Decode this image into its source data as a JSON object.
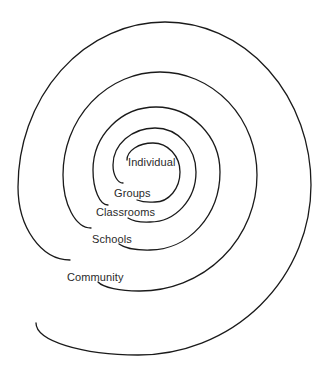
{
  "diagram": {
    "type": "spiral",
    "stroke_color": "#1a1a1a",
    "background": "#ffffff",
    "levels": [
      {
        "label": "Individual",
        "order": 1
      },
      {
        "label": "Groups",
        "order": 2
      },
      {
        "label": "Classrooms",
        "order": 3
      },
      {
        "label": "Schools",
        "order": 4
      },
      {
        "label": "Community",
        "order": 5
      }
    ]
  }
}
